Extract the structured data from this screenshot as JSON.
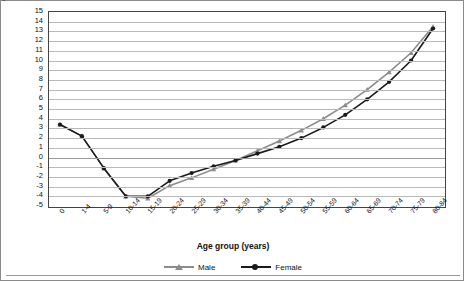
{
  "chart_data": {
    "type": "line",
    "title": "",
    "xlabel": "Age group (years)",
    "ylabel": "Component value [logit (ₙqₓ)]",
    "ylim": [
      -5,
      15
    ],
    "ytick_step": 1,
    "grid": true,
    "legend_position": "bottom-center",
    "categories": [
      "0",
      "1-4",
      "5-9",
      "10-14",
      "15-19",
      "20-24",
      "25-29",
      "30-34",
      "35-39",
      "40-44",
      "45-49",
      "50-54",
      "55-59",
      "60-64",
      "65-69",
      "70-74",
      "75-79",
      "80-84"
    ],
    "yticks": [
      "15",
      "14",
      "13",
      "12",
      "11",
      "10",
      "9",
      "8",
      "7",
      "6",
      "5",
      "4",
      "3",
      "2",
      "1",
      "0",
      "-1",
      "-2",
      "-3",
      "-4",
      "-5"
    ],
    "series": [
      {
        "name": "Male",
        "color": "#8c8c8c",
        "marker": "triangle",
        "values": [
          3.4,
          2.2,
          -1.1,
          -4.0,
          -4.2,
          -2.9,
          -2.1,
          -1.2,
          -0.3,
          0.7,
          1.7,
          2.8,
          4.0,
          5.4,
          7.0,
          8.8,
          10.8,
          13.5
        ]
      },
      {
        "name": "Female",
        "color": "#1a1a1a",
        "marker": "circle",
        "values": [
          3.4,
          2.2,
          -1.1,
          -4.0,
          -4.0,
          -2.4,
          -1.6,
          -0.9,
          -0.3,
          0.4,
          1.1,
          2.0,
          3.1,
          4.4,
          6.0,
          7.8,
          10.0,
          13.3
        ]
      }
    ]
  },
  "legend": {
    "items": [
      {
        "label": "Male"
      },
      {
        "label": "Female"
      }
    ]
  },
  "colors": {
    "male": "#8c8c8c",
    "female": "#1a1a1a",
    "grid": "#b9b9b9",
    "plot_border": "#444444",
    "figure_border": "#8a8a8a"
  }
}
